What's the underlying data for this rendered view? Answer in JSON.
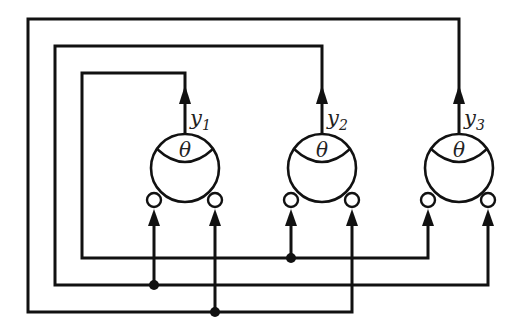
{
  "diagram": {
    "title": "",
    "colors": {
      "stroke": "#111111",
      "background": "#ffffff"
    },
    "threshold_symbol": "θ",
    "neurons": [
      {
        "id": "n1",
        "output_var": "y",
        "output_sub": "1",
        "threshold": "θ"
      },
      {
        "id": "n2",
        "output_var": "y",
        "output_sub": "2",
        "threshold": "θ"
      },
      {
        "id": "n3",
        "output_var": "y",
        "output_sub": "3",
        "threshold": "θ"
      }
    ],
    "connections": [
      {
        "from": "y1",
        "to": [
          "n2.input_left",
          "n3.input_left"
        ]
      },
      {
        "from": "y2",
        "to": [
          "n1.input_left",
          "n3.input_right"
        ]
      },
      {
        "from": "y3",
        "to": [
          "n1.input_right",
          "n2.input_right"
        ]
      }
    ]
  }
}
